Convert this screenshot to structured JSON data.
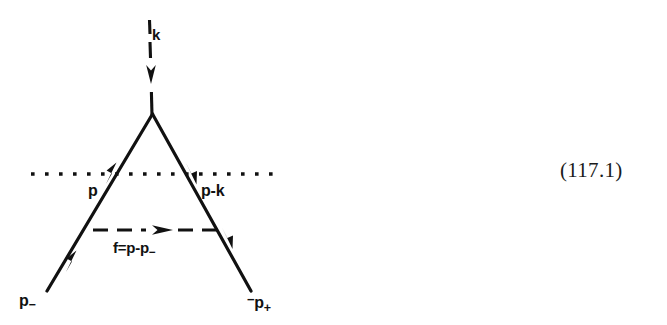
{
  "figure": {
    "kind": "feynman-diagram",
    "ink_color": "#111111",
    "background_color": "#ffffff",
    "labels": {
      "photon_momentum": "k",
      "left_internal_momentum": "p",
      "right_internal_momentum": "p-k",
      "exchange_momentum_prefix": "f=p-p",
      "exchange_momentum_subscript": "−",
      "incoming_electron_base": "p",
      "incoming_electron_subscript": "−",
      "outgoing_positron_superscript": "−",
      "outgoing_positron_base": "p",
      "outgoing_positron_subscript": "+"
    },
    "parts": [
      {
        "name": "photon-line-k",
        "style": "dashed-vertical",
        "from": [
          150,
          20
        ],
        "to": [
          152,
          115
        ],
        "arrow": "down"
      },
      {
        "name": "fermion-line-left",
        "style": "solid",
        "from": [
          152,
          115
        ],
        "to": [
          48,
          290
        ],
        "arrows": [
          "up-right-at-cut",
          "up-right-lower"
        ]
      },
      {
        "name": "fermion-line-right",
        "style": "solid",
        "from": [
          152,
          115
        ],
        "to": [
          250,
          290
        ],
        "arrows": [
          "down-right-at-cut",
          "down-right-lower"
        ]
      },
      {
        "name": "cut-line-dotted",
        "style": "dotted-horizontal",
        "from": [
          30,
          174
        ],
        "to": [
          277,
          174
        ]
      },
      {
        "name": "exchange-line-f",
        "style": "dashed-horizontal",
        "from": [
          93,
          230
        ],
        "to": [
          218,
          230
        ],
        "arrow": "right"
      }
    ]
  },
  "equation": {
    "number": "(117.1)"
  }
}
